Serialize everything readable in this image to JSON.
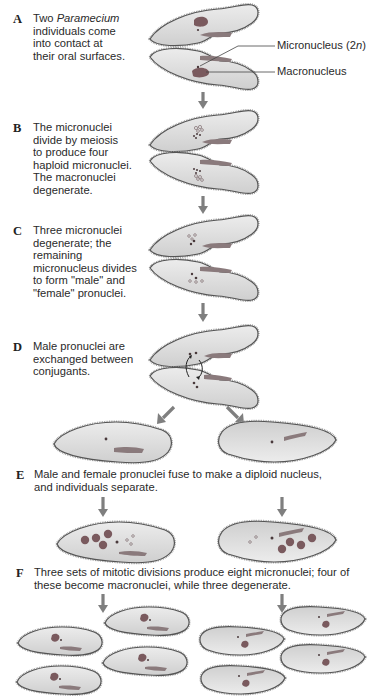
{
  "steps": [
    {
      "letter": "A",
      "lines": [
        "Two Paramecium",
        "individuals come",
        "into contact at",
        "their oral surfaces."
      ],
      "italic_word": "Paramecium"
    },
    {
      "letter": "B",
      "lines": [
        "The micronuclei",
        "divide by meiosis",
        "to produce four",
        "haploid micronuclei.",
        "The macronuclei",
        "degenerate."
      ]
    },
    {
      "letter": "C",
      "lines": [
        "Three micronuclei",
        "degenerate; the",
        "remaining",
        "micronucleus divides",
        "to form \"male\" and",
        "\"female\" pronuclei."
      ]
    },
    {
      "letter": "D",
      "lines": [
        "Male pronuclei are",
        "exchanged between",
        "conjugants."
      ]
    },
    {
      "letter": "E",
      "lines": [
        "Male and female pronuclei fuse to make a diploid nucleus,",
        "and individuals separate."
      ]
    },
    {
      "letter": "F",
      "lines": [
        "Three sets of mitotic divisions produce eight micronuclei; four of",
        "these become macronuclei, while three degenerate."
      ]
    }
  ],
  "labels": {
    "micronucleus": "Micronucleus (2",
    "micronucleus_n": "n",
    "micronucleus_close": ")",
    "macronucleus": "Macronucleus"
  },
  "colors": {
    "cell_fill": "#dcdcdc",
    "cell_outline": "#555555",
    "cilia": "#9a9a9a",
    "nucleus": "#7a5a5e",
    "arrow": "#7f7f7f"
  }
}
